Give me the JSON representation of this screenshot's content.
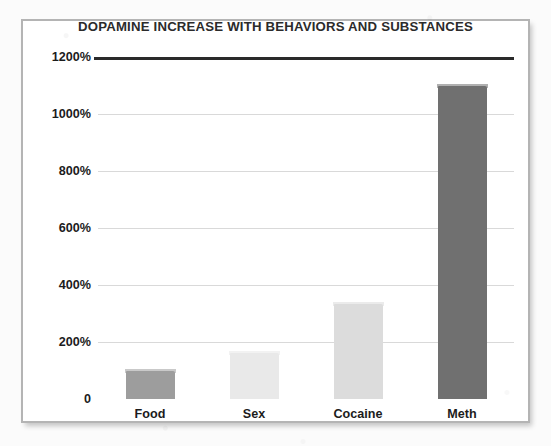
{
  "chart_data": {
    "type": "bar",
    "title": "DOPAMINE INCREASE WITH BEHAVIORS AND SUBSTANCES",
    "xlabel": "",
    "ylabel": "",
    "categories": [
      "Food",
      "Sex",
      "Cocaine",
      "Meth"
    ],
    "values": [
      100,
      160,
      335,
      1100
    ],
    "value_unit": "%",
    "ylim": [
      0,
      1200
    ],
    "ytick_values": [
      0,
      200,
      400,
      600,
      800,
      1000,
      1200
    ],
    "ytick_labels": [
      "0",
      "200%",
      "400%",
      "600%",
      "800%",
      "1000%",
      "1200%"
    ],
    "grid": true,
    "legend": "none",
    "bar_colors": [
      "#9d9d9d",
      "#e9e9e9",
      "#dcdcdc",
      "#707070"
    ],
    "axis_color": "#2a2a2a",
    "gridline_color": "#d9d9d9",
    "frame_border_color": "#b4b4b4",
    "background_color": "#ffffff"
  }
}
